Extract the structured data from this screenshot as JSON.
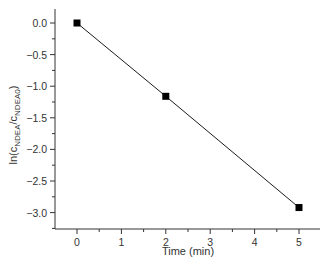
{
  "chart_data": {
    "type": "line",
    "title": "",
    "xlabel": "Time (min)",
    "ylabel": "ln(c_NDEA/c_NDEA0)",
    "ylabel_parts": {
      "prefix": "ln(c",
      "sub1": "NDEA",
      "mid": "/c",
      "sub2": "NDEA0",
      "suffix": ")"
    },
    "x_ticks": [
      0,
      1,
      2,
      3,
      4,
      5
    ],
    "x_tick_labels": [
      "0",
      "1",
      "2",
      "3",
      "4",
      "5"
    ],
    "y_ticks": [
      0.0,
      -0.5,
      -1.0,
      -1.5,
      -2.0,
      -2.5,
      -3.0
    ],
    "y_tick_labels": [
      "0.0",
      "-0.5",
      "-1.0",
      "-1.5",
      "-2.0",
      "-2.5",
      "-3.0"
    ],
    "xlim": [
      -0.5,
      5.45
    ],
    "ylim": [
      -3.25,
      0.22
    ],
    "grid": false,
    "legend": null,
    "series": [
      {
        "name": "ln(c_NDEA/c_NDEA0)",
        "x": [
          0,
          2,
          5
        ],
        "values": [
          0.0,
          -1.16,
          -2.92
        ],
        "marker": "square",
        "color": "#000000"
      }
    ]
  }
}
